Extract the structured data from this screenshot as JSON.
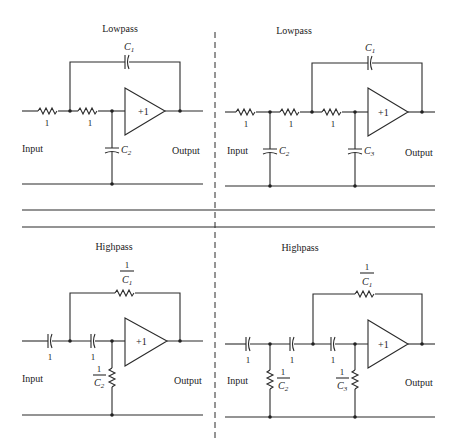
{
  "figure": {
    "panels": [
      {
        "id": "lowpass-2nd",
        "title": "Lowpass",
        "input_label": "Input",
        "output_label": "Output",
        "amp_gain": "+1",
        "series_labels": [
          "1",
          "1"
        ],
        "feedback_label": "C",
        "feedback_sub": "1",
        "shunt": [
          {
            "label": "C",
            "sub": "2"
          }
        ]
      },
      {
        "id": "lowpass-3rd",
        "title": "Lowpass",
        "input_label": "Input",
        "output_label": "Output",
        "amp_gain": "+1",
        "series_labels": [
          "1",
          "1",
          "1"
        ],
        "feedback_label": "C",
        "feedback_sub": "1",
        "shunt": [
          {
            "label": "C",
            "sub": "2"
          },
          {
            "label": "C",
            "sub": "3"
          }
        ]
      },
      {
        "id": "highpass-2nd",
        "title": "Highpass",
        "input_label": "Input",
        "output_label": "Output",
        "amp_gain": "+1",
        "series_labels": [
          "1",
          "1"
        ],
        "feedback_num": "1",
        "feedback_label": "C",
        "feedback_sub": "1",
        "shunt": [
          {
            "num": "1",
            "label": "C",
            "sub": "2"
          }
        ]
      },
      {
        "id": "highpass-3rd",
        "title": "Highpass",
        "input_label": "Input",
        "output_label": "Output",
        "amp_gain": "+1",
        "series_labels": [
          "1",
          "1",
          "1"
        ],
        "feedback_num": "1",
        "feedback_label": "C",
        "feedback_sub": "1",
        "shunt": [
          {
            "num": "1",
            "label": "C",
            "sub": "2"
          },
          {
            "num": "1",
            "label": "C",
            "sub": "3"
          }
        ]
      }
    ]
  }
}
